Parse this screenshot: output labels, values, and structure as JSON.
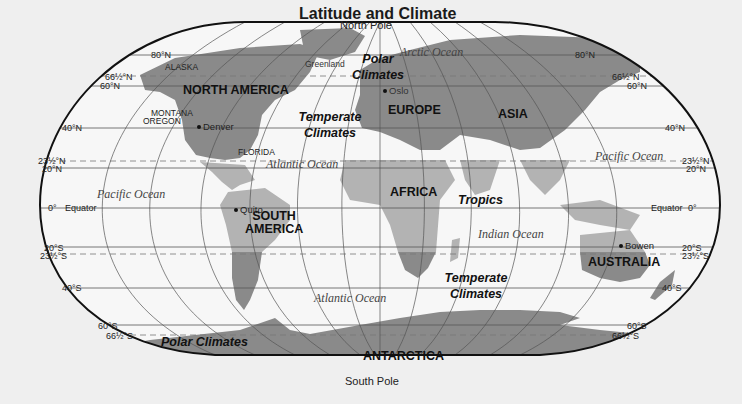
{
  "title": "Latitude and Climate",
  "poles": {
    "north": "North Pole",
    "south": "South Pole"
  },
  "latitudes": {
    "left": [
      "80°N",
      "66½°N",
      "60°N",
      "40°N",
      "23½°N",
      "20°N",
      "0°",
      "20°S",
      "23½°S",
      "40°S",
      "60°S",
      "66½°S"
    ],
    "right": [
      "80°N",
      "66½°N",
      "60°N",
      "40°N",
      "23½°N",
      "20°N",
      "0°",
      "20°S",
      "23½°S",
      "40°S",
      "60°S",
      "66½°S"
    ],
    "equator_label": "Equator"
  },
  "continents": {
    "north_america": "NORTH AMERICA",
    "south_america": "SOUTH AMERICA",
    "europe": "EUROPE",
    "asia": "ASIA",
    "africa": "AFRICA",
    "australia": "AUSTRALIA",
    "antarctica": "ANTARCTICA"
  },
  "oceans": {
    "arctic": "Arctic Ocean",
    "atlantic_north": "Atlantic Ocean",
    "atlantic_south": "Atlantic Ocean",
    "pacific_west": "Pacific Ocean",
    "pacific_east": "Pacific Ocean",
    "indian": "Indian Ocean"
  },
  "climate_zones": {
    "polar_north": "Polar Climates",
    "temperate_north": "Temperate Climates",
    "tropics": "Tropics",
    "temperate_south": "Temperate Climates",
    "polar_south": "Polar Climates"
  },
  "places": {
    "alaska": "ALASKA",
    "greenland": "Greenland",
    "montana": "MONTANA",
    "oregon": "OREGON",
    "florida": "FLORIDA",
    "denver": "Denver",
    "oslo": "Oslo",
    "quito": "Quito",
    "bowen": "Bowen"
  },
  "colors": {
    "background": "#efefef",
    "ocean": "#f7f7f7",
    "land_polar_temperate": "#8a8a8a",
    "land_tropics": "#b3b3b3",
    "grid": "#555555",
    "outline": "#111111"
  }
}
